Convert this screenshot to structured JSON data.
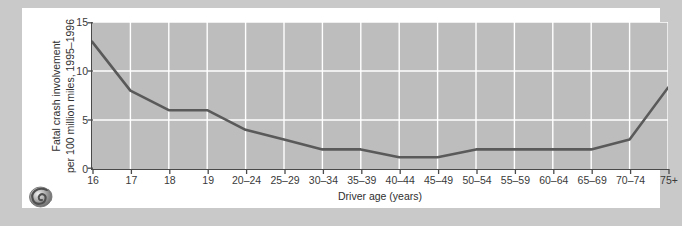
{
  "figure": {
    "background_color": "#c9c9c9",
    "card_color": "#ffffff",
    "plot_background_color": "#bdbdbd",
    "grid_color": "#ffffff",
    "line_color": "#5a5a5a",
    "axis_color": "#4a4a4a",
    "logo_name": "spiral-shell-logo"
  },
  "chart_data": {
    "type": "line",
    "title": "",
    "xlabel": "Driver age (years)",
    "ylabel": "Fatal crash involvement per 100 million miles, 1995–1996",
    "ylabel_line1": "Fatal crash involvement",
    "ylabel_line2": "per 100 million miles, 1995–1996",
    "categories": [
      "16",
      "17",
      "18",
      "19",
      "20–24",
      "25–29",
      "30–34",
      "35–39",
      "40–44",
      "45–49",
      "50–54",
      "55–59",
      "60–64",
      "65–69",
      "70–74",
      "75+"
    ],
    "values": [
      13.0,
      8.0,
      6.0,
      6.0,
      4.0,
      3.0,
      2.0,
      2.0,
      1.2,
      1.2,
      2.0,
      2.0,
      2.0,
      2.0,
      3.0,
      8.3
    ],
    "series": [
      {
        "name": "Fatal crash involvement rate",
        "values": [
          13.0,
          8.0,
          6.0,
          6.0,
          4.0,
          3.0,
          2.0,
          2.0,
          1.2,
          1.2,
          2.0,
          2.0,
          2.0,
          2.0,
          3.0,
          8.3
        ]
      }
    ],
    "ylim": [
      0,
      15
    ],
    "yticks": [
      0,
      5,
      10,
      15
    ],
    "ytick_labels": [
      "0",
      "5",
      "10",
      "15"
    ],
    "grid": true,
    "grid_axis": "both",
    "legend": "none",
    "x_gridlines_at": [
      "17",
      "18",
      "19",
      "20–24",
      "25–29",
      "30–34",
      "35–39",
      "40–44",
      "45–49",
      "50–54",
      "55–59",
      "60–64",
      "65–69",
      "70–74",
      "75+"
    ]
  }
}
